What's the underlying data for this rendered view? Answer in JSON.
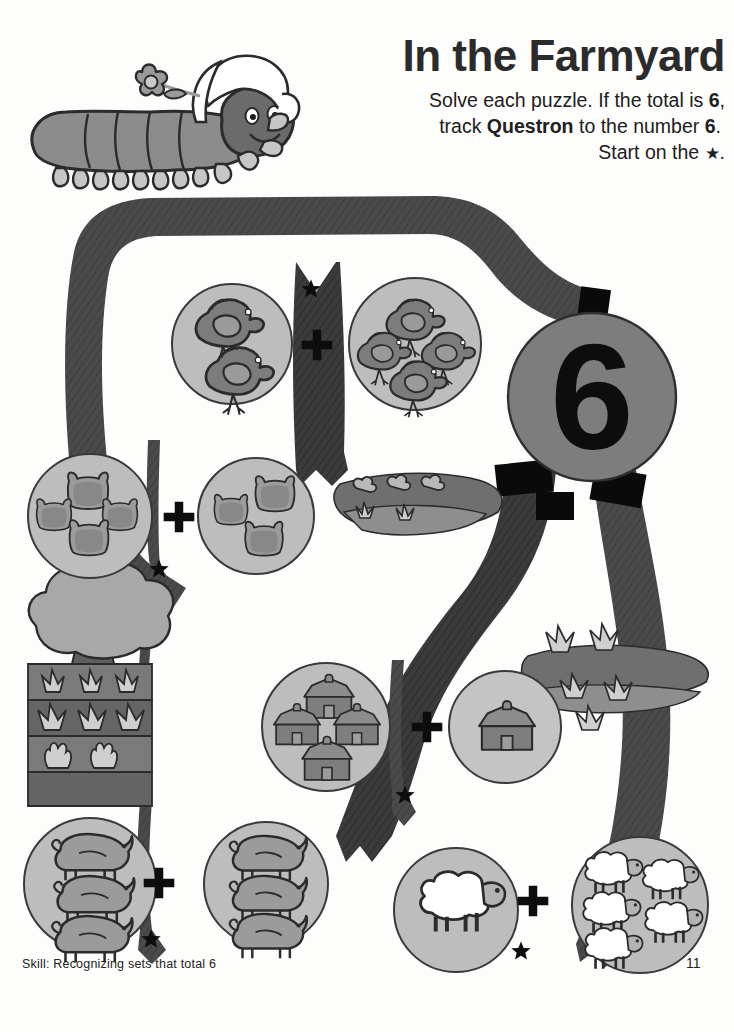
{
  "page": {
    "title": "In the Farmyard",
    "instructions": {
      "line1_pre": "Solve each puzzle. If the total is ",
      "line1_num": "6",
      "line1_post": ",",
      "line2_pre": "track ",
      "line2_char": "Questron",
      "line2_mid": " to the number ",
      "line2_num": "6",
      "line2_post": ".",
      "line3_pre": "Start on the ",
      "line3_star": "★",
      "line3_post": "."
    },
    "footer_skill": "Skill: Recognizing sets that total 6",
    "page_number": "11",
    "target_number": "6"
  },
  "character": {
    "name": "Questron",
    "kind": "caterpillar-with-bonnet-and-flower"
  },
  "colors": {
    "ribbon_dark": "#4a4a4a",
    "ribbon_black": "#000000",
    "circle_fill": "#bdbdbd",
    "circle_stroke": "#3a3a3a",
    "animal_fill": "#8c8c8c",
    "animal_dark": "#6e6e6e",
    "target_circle_fill": "#7d7d7d",
    "field_dark": "#6e6e6e",
    "field_mid": "#8c8c8c",
    "tree_fill": "#a8a8a8",
    "sheep_fill": "#ffffff",
    "text": "#202020",
    "page_bg": "#fdfdfc"
  },
  "puzzles": [
    {
      "id": "puzzle-chickens",
      "left_count": 2,
      "left_item": "chicken",
      "operator": "+",
      "right_count": 4,
      "right_item": "chicken",
      "total": 6,
      "matches_target": true,
      "has_start_star": true
    },
    {
      "id": "puzzle-cows",
      "left_count": 4,
      "left_item": "cow",
      "operator": "+",
      "right_count": 3,
      "right_item": "cow",
      "total": 7,
      "matches_target": false,
      "has_start_star": true
    },
    {
      "id": "puzzle-barns",
      "left_count": 4,
      "left_item": "barn",
      "operator": "+",
      "right_count": 1,
      "right_item": "barn",
      "total": 5,
      "matches_target": false,
      "has_start_star": true
    },
    {
      "id": "puzzle-pigs",
      "left_count": 3,
      "left_item": "pig",
      "operator": "+",
      "right_count": 3,
      "right_item": "pig",
      "total": 6,
      "matches_target": true,
      "has_start_star": true
    },
    {
      "id": "puzzle-sheep",
      "left_count": 1,
      "left_item": "sheep",
      "operator": "+",
      "right_count": 5,
      "right_item": "sheep",
      "total": 6,
      "matches_target": true,
      "has_start_star": true
    }
  ],
  "scenery": [
    {
      "name": "tree",
      "position": "mid-left"
    },
    {
      "name": "crop-field-rows",
      "position": "mid-left"
    },
    {
      "name": "bushes",
      "position": "center"
    },
    {
      "name": "grass-field",
      "position": "center-right"
    },
    {
      "name": "grass-field",
      "position": "right"
    }
  ]
}
